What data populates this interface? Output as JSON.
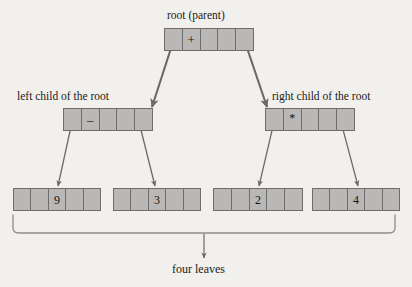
{
  "diagram": {
    "background_color": "#f2f0ec",
    "node_fill_color": "#b9b8b6",
    "node_border_color": "#6e6d6b",
    "arrow_color": "#5a5a58",
    "text_color": "#1a1a1a"
  },
  "labels": {
    "root": "root (parent)",
    "left_child": "left child of the root",
    "right_child": "right child of the root",
    "leaves": "four leaves"
  },
  "nodes": {
    "root": {
      "name": "root",
      "cells": [
        "",
        "+",
        "",
        "",
        ""
      ],
      "value": "+",
      "value_cell_index": 1,
      "cell_count": 5
    },
    "left_child": {
      "name": "left child",
      "cells": [
        "",
        "–",
        "",
        "",
        ""
      ],
      "value": "–",
      "value_cell_index": 1,
      "cell_count": 5
    },
    "right_child": {
      "name": "right child",
      "cells": [
        "",
        "*",
        "",
        "",
        ""
      ],
      "value": "*",
      "value_cell_index": 1,
      "cell_count": 5
    },
    "leaves": [
      {
        "name": "leaf 1",
        "cells": [
          "",
          "",
          "9",
          "",
          ""
        ],
        "value": "9",
        "value_cell_index": 2,
        "cell_count": 5
      },
      {
        "name": "leaf 2",
        "cells": [
          "",
          "",
          "3",
          "",
          ""
        ],
        "value": "3",
        "value_cell_index": 2,
        "cell_count": 5
      },
      {
        "name": "leaf 3",
        "cells": [
          "",
          "",
          "2",
          "",
          ""
        ],
        "value": "2",
        "value_cell_index": 2,
        "cell_count": 5
      },
      {
        "name": "leaf 4",
        "cells": [
          "",
          "",
          "4",
          "",
          ""
        ],
        "value": "4",
        "value_cell_index": 2,
        "cell_count": 5
      }
    ]
  },
  "edges": [
    {
      "from": "root",
      "to": "left_child"
    },
    {
      "from": "root",
      "to": "right_child"
    },
    {
      "from": "left_child",
      "to": "leaf_1"
    },
    {
      "from": "left_child",
      "to": "leaf_2"
    },
    {
      "from": "right_child",
      "to": "leaf_3"
    },
    {
      "from": "right_child",
      "to": "leaf_4"
    },
    {
      "from": "leaves_brace",
      "to": "leaves_label"
    }
  ]
}
